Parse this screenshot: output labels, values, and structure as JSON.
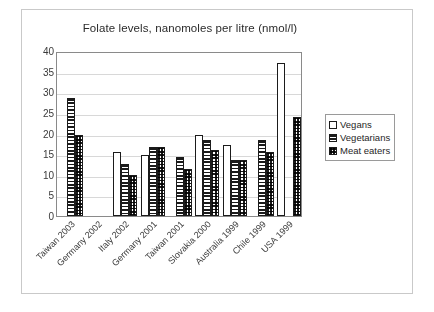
{
  "chart_data": {
    "type": "bar",
    "title": "Folate levels, nanomoles per litre (nmol/l)",
    "xlabel": "",
    "ylabel": "",
    "ylim": [
      0,
      40
    ],
    "ytick_step": 5,
    "yticks": [
      40,
      35,
      30,
      25,
      20,
      15,
      10,
      5,
      0
    ],
    "grid": true,
    "legend_position": "right",
    "categories": [
      "Taiwan 2003",
      "Germany 2002",
      "Italy 2002",
      "Germany 2001",
      "Taiwan 2001",
      "Slovakia 2000",
      "Australia 1999",
      "Chile 1999",
      "USA 1999"
    ],
    "series": [
      {
        "name": "Vegans",
        "pattern": "plain",
        "values": [
          null,
          null,
          15.5,
          14.9,
          null,
          19.7,
          17.1,
          null,
          37.1
        ]
      },
      {
        "name": "Vegetarians",
        "pattern": "horizontal-stripe",
        "values": [
          28.5,
          null,
          12.5,
          16.8,
          14.4,
          18.4,
          13.7,
          18.4,
          null
        ]
      },
      {
        "name": "Meat eaters",
        "pattern": "checker",
        "values": [
          19.7,
          null,
          10.0,
          16.8,
          11.5,
          15.9,
          13.5,
          15.4,
          24.0
        ]
      }
    ]
  },
  "legend": {
    "items": [
      {
        "label": "Vegans",
        "pattern": "plain"
      },
      {
        "label": "Vegetarians",
        "pattern": "horizontal-stripe"
      },
      {
        "label": "Meat eaters",
        "pattern": "checker"
      }
    ]
  },
  "colors": {
    "bar_outline": "#1b1b1b",
    "bar_fill": "#ffffff",
    "gridline": "#d8d8d8",
    "plot_border": "#8a8a8a",
    "figure_border": "#c9c9c9",
    "text": "#2b2b2b",
    "background": "#ffffff"
  }
}
